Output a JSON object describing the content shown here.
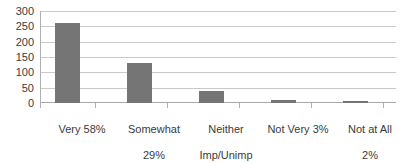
{
  "chart_data": {
    "type": "bar",
    "title": "",
    "subtitle": "",
    "xlabel": "",
    "ylabel": "",
    "categories": [
      "Very 58%",
      "Somewhat 29%",
      "Neither Imp/Unimp 9%",
      "Not Very 3%",
      "Not at All 2%"
    ],
    "category_lines": [
      [
        "Very 58%"
      ],
      [
        "Somewhat",
        "29%"
      ],
      [
        "Neither",
        "Imp/Unimp",
        "9%"
      ],
      [
        "Not Very 3%"
      ],
      [
        "Not at All",
        "2%"
      ]
    ],
    "values": [
      264,
      133,
      39,
      10,
      5
    ],
    "percent_labels": [
      "58%",
      "29%",
      "9%",
      "3%",
      "2%"
    ],
    "ylim": [
      0,
      300
    ],
    "ytick_labels": [
      "0",
      "50",
      "100",
      "150",
      "200",
      "250",
      "300"
    ],
    "ytick_values": [
      0,
      50,
      100,
      150,
      200,
      250,
      300
    ],
    "grid": true,
    "legend": false,
    "legend_position": "none",
    "bar_color": "#757575",
    "gridline_color": "#c9c9c9",
    "axis_color": "#b0b0b0",
    "text_color": "#3b3b3b",
    "background_color": "#ffffff"
  }
}
